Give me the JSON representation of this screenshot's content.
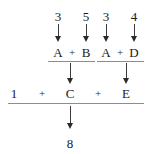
{
  "figure": {
    "ink_color": "#1a1a1a",
    "rule_color": "#8d8d8d",
    "arrow_color": "#2a2a2a"
  },
  "inputs": [
    {
      "label": "3",
      "x": 58,
      "y": 16
    },
    {
      "label": "5",
      "x": 86,
      "y": 16
    },
    {
      "label": "3",
      "x": 106,
      "y": 16
    },
    {
      "label": "4",
      "x": 134,
      "y": 16
    }
  ],
  "operand_row": {
    "left_group": {
      "terms": [
        {
          "label": "A",
          "x": 58,
          "y": 52
        },
        {
          "label": "+",
          "x": 72,
          "y": 52
        },
        {
          "label": "B",
          "x": 86,
          "y": 52
        }
      ],
      "rule": {
        "x": 48,
        "y": 61,
        "width": 47
      }
    },
    "right_group": {
      "terms": [
        {
          "label": "A",
          "x": 106,
          "y": 52
        },
        {
          "label": "+",
          "x": 120,
          "y": 52
        },
        {
          "label": "D",
          "x": 134,
          "y": 52
        }
      ],
      "rule": {
        "x": 97,
        "y": 61,
        "width": 47
      }
    }
  },
  "sum_row": {
    "terms": [
      {
        "label": "1",
        "x": 14,
        "y": 93
      },
      {
        "label": "+",
        "x": 42,
        "y": 93
      },
      {
        "label": "C",
        "x": 70,
        "y": 93
      },
      {
        "label": "+",
        "x": 98,
        "y": 93
      },
      {
        "label": "E",
        "x": 126,
        "y": 93
      }
    ],
    "rule": {
      "x": 8,
      "y": 103,
      "width": 136
    }
  },
  "result": {
    "label": "8",
    "x": 70,
    "y": 143
  },
  "arrows": [
    {
      "name": "input-3-to-A-left",
      "x": 58,
      "y": 24,
      "length": 18
    },
    {
      "name": "input-5-to-B",
      "x": 86,
      "y": 24,
      "length": 18
    },
    {
      "name": "input-3-to-A-right",
      "x": 106,
      "y": 24,
      "length": 18
    },
    {
      "name": "input-4-to-D",
      "x": 134,
      "y": 24,
      "length": 18
    },
    {
      "name": "left-group-to-C",
      "x": 70,
      "y": 63,
      "length": 21
    },
    {
      "name": "right-group-to-E",
      "x": 126,
      "y": 63,
      "length": 21
    },
    {
      "name": "sum-to-result",
      "x": 70,
      "y": 106,
      "length": 23
    }
  ]
}
